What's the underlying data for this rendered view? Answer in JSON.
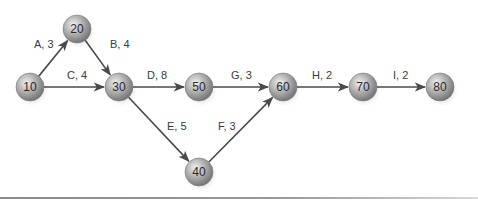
{
  "diagram": {
    "type": "activity-on-arrow network",
    "nodes": [
      {
        "id": "10",
        "label": "10",
        "x": 30,
        "y": 87
      },
      {
        "id": "20",
        "label": "20",
        "x": 77,
        "y": 29
      },
      {
        "id": "30",
        "label": "30",
        "x": 119,
        "y": 87
      },
      {
        "id": "40",
        "label": "40",
        "x": 199,
        "y": 172
      },
      {
        "id": "50",
        "label": "50",
        "x": 199,
        "y": 87
      },
      {
        "id": "60",
        "label": "60",
        "x": 283,
        "y": 87
      },
      {
        "id": "70",
        "label": "70",
        "x": 363,
        "y": 87
      },
      {
        "id": "80",
        "label": "80",
        "x": 440,
        "y": 87
      }
    ],
    "edges": [
      {
        "from": "10",
        "to": "20",
        "activity": "A",
        "duration": 3,
        "label": "A, 3",
        "lx": 34,
        "ly": 48
      },
      {
        "from": "20",
        "to": "30",
        "activity": "B",
        "duration": 4,
        "label": "B, 4",
        "lx": 110,
        "ly": 48
      },
      {
        "from": "10",
        "to": "30",
        "activity": "C",
        "duration": 4,
        "label": "C, 4",
        "lx": 67,
        "ly": 79
      },
      {
        "from": "30",
        "to": "50",
        "activity": "D",
        "duration": 8,
        "label": "D, 8",
        "lx": 147,
        "ly": 79
      },
      {
        "from": "30",
        "to": "40",
        "activity": "E",
        "duration": 5,
        "label": "E, 5",
        "lx": 167,
        "ly": 130
      },
      {
        "from": "40",
        "to": "60",
        "activity": "F",
        "duration": 3,
        "label": "F, 3",
        "lx": 218,
        "ly": 130
      },
      {
        "from": "50",
        "to": "60",
        "activity": "G",
        "duration": 3,
        "label": "G, 3",
        "lx": 231,
        "ly": 79
      },
      {
        "from": "60",
        "to": "70",
        "activity": "H",
        "duration": 2,
        "label": "H, 2",
        "lx": 312,
        "ly": 79
      },
      {
        "from": "70",
        "to": "80",
        "activity": "I",
        "duration": 2,
        "label": "I, 2",
        "lx": 393,
        "ly": 79
      }
    ],
    "node_radius": 14,
    "colors": {
      "edge": "#4a4a4a",
      "node_light": "#e6e6e6",
      "node_mid": "#a8a8a8",
      "node_dark": "#6a6a6a",
      "text": "#2a2a2a"
    }
  }
}
